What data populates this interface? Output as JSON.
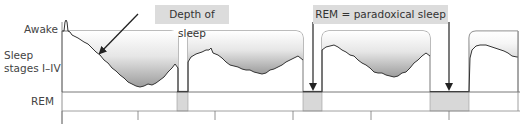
{
  "labels": {
    "awake": "Awake",
    "sleep_stages_line1": "Sleep",
    "sleep_stages_line2": "stages I–IV",
    "rem": "REM"
  },
  "callouts": {
    "depth": "Depth of sleep",
    "rem": "REM = paradoxical sleep"
  },
  "colors": {
    "line": "#333333",
    "rem_fill": "#d8d8d8",
    "callout_bg": "#dcdcdc",
    "gradient_top": "#ffffff",
    "gradient_bottom": "#a9a9a9"
  },
  "cycles": [
    {
      "x0": 62,
      "x1": 178
    },
    {
      "x0": 188,
      "x1": 303
    },
    {
      "x0": 322,
      "x1": 430
    },
    {
      "x0": 469,
      "x1": 518
    }
  ],
  "rem_blocks": [
    {
      "x0": 177,
      "x1": 188
    },
    {
      "x0": 303,
      "x1": 322
    },
    {
      "x0": 430,
      "x1": 469
    }
  ],
  "ticks_x": [
    62,
    138,
    215,
    293,
    371,
    449
  ]
}
